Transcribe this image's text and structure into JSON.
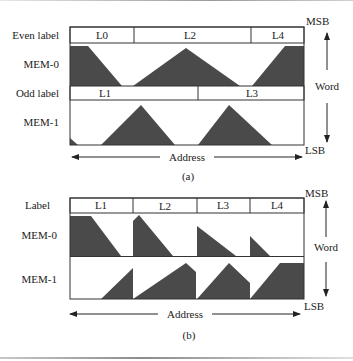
{
  "figure_a": {
    "caption": "(a)",
    "row_labels": {
      "even_label": "Even label",
      "mem0": "MEM-0",
      "odd_label": "Odd label",
      "mem1": "MEM-1"
    },
    "even_labels": [
      "L0",
      "L2",
      "L4"
    ],
    "odd_labels": [
      "L1",
      "L3"
    ],
    "msb": "MSB",
    "lsb": "LSB",
    "word": "Word",
    "address": "Address"
  },
  "figure_b": {
    "caption": "(b)",
    "row_labels": {
      "label": "Label",
      "mem0": "MEM-0",
      "mem1": "MEM-1"
    },
    "labels": [
      "L1",
      "L2",
      "L3",
      "L4"
    ],
    "msb": "MSB",
    "lsb": "LSB",
    "word": "Word",
    "address": "Address"
  },
  "colors": {
    "fill": "#4a4a4a",
    "stroke": "#333333"
  }
}
